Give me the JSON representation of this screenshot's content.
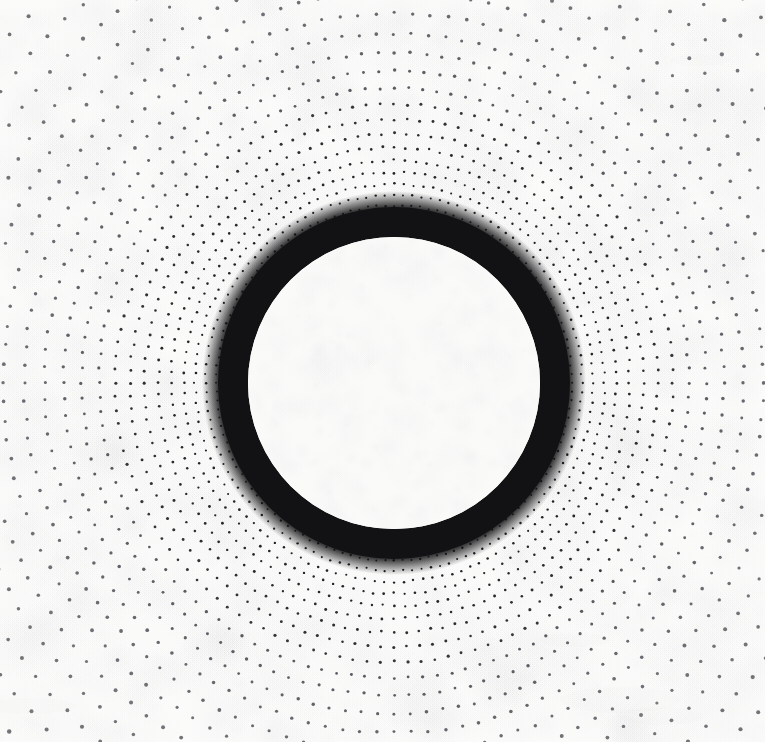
{
  "artwork": {
    "title": "Radial Halftone Dot Burst",
    "medium_note": "printed halftone on paper",
    "canvas": {
      "width": 765,
      "height": 742,
      "background_color": "#fbfbfa",
      "paper_texture": true
    }
  },
  "chart_data": {
    "type": "scatter",
    "subtitle": "",
    "xlabel": "",
    "ylabel": "",
    "grid": false,
    "legend": null,
    "axis_visible": false,
    "tick_labels": [],
    "annotations": [],
    "coordinate_system": "polar",
    "center": {
      "x": 394,
      "y": 383
    },
    "xlim": [
      0,
      765
    ],
    "ylim": [
      0,
      742
    ],
    "geometry": {
      "ray_count": 128,
      "angle_step_degrees": 2.8125,
      "start_angle_degrees": -90,
      "inner_white_disk_radius": 146,
      "solid_ring_outer_radius": 176,
      "ring_fill_color": "#121214",
      "dot_start_radius": 150,
      "dot_max_radius": 640,
      "radial_growth_ratio": 1.058,
      "dot_radius_min": 0.75,
      "dot_radius_max": 2.15,
      "dot_size_growth_exponent": 0.52
    },
    "colors": {
      "dot_color": "#3a3a42",
      "dot_color_dense": "#141417",
      "background": "#fbfbfa",
      "inner_disk": "#fafaf9",
      "ring": "#121214"
    },
    "series": [
      {
        "name": "radial dot rays",
        "description": "128 rays of halftone dots radiating from center; dot spacing grows geometrically with radius so dots merge into a solid black annulus near the inner disk and scatter sparsely at the outer field",
        "point_count_approx": 11000
      }
    ]
  }
}
